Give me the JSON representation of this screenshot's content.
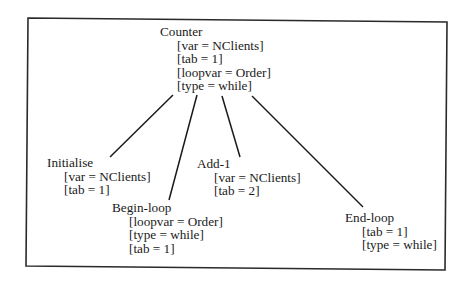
{
  "diagram": {
    "type": "tree",
    "colors": {
      "line": "#1a1a1a",
      "frame": "#2a2a2a",
      "background": "#ffffff",
      "text": "#1a1a1a"
    },
    "root": {
      "title": "Counter",
      "attrs": [
        "[var = NClients]",
        "[tab = 1]",
        "[loopvar = Order]",
        "[type = while]"
      ]
    },
    "children": [
      {
        "title": "Initialise",
        "attrs": [
          "[var = NClients]",
          "[tab = 1]"
        ]
      },
      {
        "title": "Begin-loop",
        "attrs": [
          "[loopvar = Order]",
          "[type = while]",
          "[tab = 1]"
        ]
      },
      {
        "title": "Add-1",
        "attrs": [
          "[var = NClients]",
          "[tab = 2]"
        ]
      },
      {
        "title": "End-loop",
        "attrs": [
          "[tab = 1]",
          "[type = while]"
        ]
      }
    ],
    "edges": [
      {
        "from": "Counter",
        "to": "Initialise"
      },
      {
        "from": "Counter",
        "to": "Begin-loop"
      },
      {
        "from": "Counter",
        "to": "Add-1"
      },
      {
        "from": "Counter",
        "to": "End-loop"
      }
    ]
  }
}
